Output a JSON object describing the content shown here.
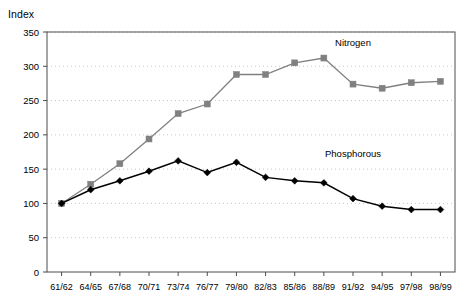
{
  "axis_title": "Index",
  "chart_data": {
    "type": "line",
    "title": "",
    "subtitle": "",
    "xlabel": "",
    "ylabel": "Index",
    "ylim": [
      0,
      350
    ],
    "yticks": [
      0,
      50,
      100,
      150,
      200,
      250,
      300,
      350
    ],
    "grid": true,
    "grid_style": "dotted-horizontal",
    "legend_position": "inline-annotation",
    "categories": [
      "61/62",
      "64/65",
      "67/68",
      "70/71",
      "73/74",
      "76/77",
      "79/80",
      "82/83",
      "85/86",
      "88/89",
      "91/92",
      "94/95",
      "97/98",
      "98/99"
    ],
    "series": [
      {
        "name": "Nitrogen",
        "color": "#808080",
        "marker": "square",
        "values": [
          100,
          128,
          158,
          194,
          231,
          245,
          288,
          288,
          305,
          312,
          274,
          268,
          276,
          278
        ]
      },
      {
        "name": "Phosphorous",
        "color": "#000000",
        "marker": "diamond",
        "values": [
          100,
          120,
          133,
          147,
          162,
          145,
          160,
          138,
          133,
          130,
          107,
          96,
          91,
          91
        ]
      }
    ],
    "annotations": [
      {
        "text": "Nitrogen",
        "x_category": "91/92",
        "y_value": 330
      },
      {
        "text": "Phosphorous",
        "x_category": "91/92",
        "y_value": 168
      }
    ]
  },
  "colors": {
    "nitrogen": "#808080",
    "phosphorous": "#000000",
    "grid": "#c8c8c8",
    "frame": "#4d4d4d",
    "background": "#ffffff"
  }
}
